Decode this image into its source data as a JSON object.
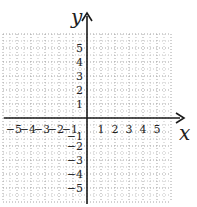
{
  "chart_data": {
    "type": "scatter",
    "title": "",
    "xlabel": "x",
    "ylabel": "y",
    "xlim": [
      -6,
      6
    ],
    "ylim": [
      -6,
      6
    ],
    "grid": true,
    "grid_style": "dotted",
    "x_ticks": [
      -5,
      -4,
      -3,
      -2,
      -1,
      1,
      2,
      3,
      4,
      5
    ],
    "y_ticks": [
      5,
      4,
      3,
      2,
      1,
      -1,
      -2,
      -3,
      -4,
      -5
    ],
    "x_tick_labels": [
      "−5",
      "−4",
      "−3",
      "−2",
      "−1",
      "1",
      "2",
      "3",
      "4",
      "5"
    ],
    "y_tick_labels": [
      "5",
      "4",
      "3",
      "2",
      "1",
      "−1",
      "−2",
      "−3",
      "−4",
      "−5"
    ],
    "series": [],
    "legend": null
  },
  "colors": {
    "axis": "#1a1a1a",
    "grid": "#9a9a9a",
    "background": "#ffffff"
  }
}
